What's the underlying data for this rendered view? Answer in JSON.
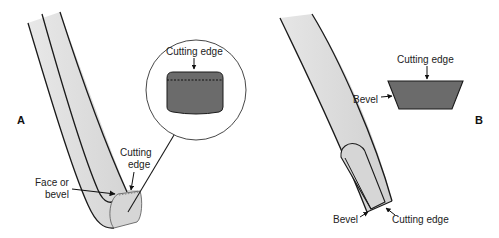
{
  "figure": {
    "panels": [
      {
        "id": "A",
        "label": "A",
        "callouts": {
          "inset_cutting_edge": "Cutting edge",
          "cutting_edge_line1": "Cutting",
          "cutting_edge_line2": "edge",
          "face_line1": "Face or",
          "face_line2": "bevel"
        }
      },
      {
        "id": "B",
        "label": "B",
        "callouts": {
          "inset_cutting_edge": "Cutting edge",
          "inset_bevel": "Bevel",
          "tip_bevel": "Bevel",
          "tip_cutting_edge": "Cutting edge"
        }
      }
    ],
    "colors": {
      "instrument_fill": "#dcdcdc",
      "blade_fill": "#6b6b6b",
      "outline": "#1a1a1a",
      "background": "#ffffff"
    }
  }
}
